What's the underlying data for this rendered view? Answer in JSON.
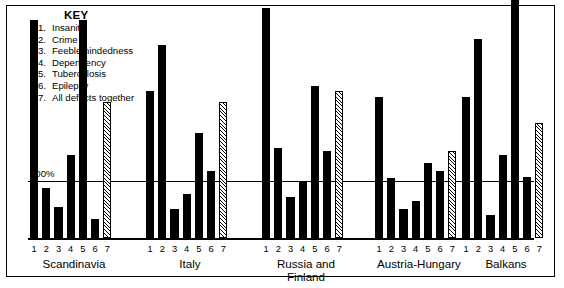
{
  "key": {
    "title": "KEY",
    "items": [
      {
        "num": "1.",
        "label": "Insanity"
      },
      {
        "num": "2.",
        "label": "Crime"
      },
      {
        "num": "3.",
        "label": "Feeblemindedness"
      },
      {
        "num": "4.",
        "label": "Dependency"
      },
      {
        "num": "5.",
        "label": "Tuberculosis"
      },
      {
        "num": "6.",
        "label": "Epilepsy"
      },
      {
        "num": "7.",
        "label": "All defects together"
      }
    ]
  },
  "axis": {
    "reference_label": "100%"
  },
  "chart_data": {
    "type": "bar",
    "title": "",
    "xlabel": "",
    "ylabel": "",
    "ylim": [
      0,
      470
    ],
    "grid": false,
    "reference_line": 100,
    "reference_line_label": "100%",
    "legend_position": "top-left",
    "categories": [
      "1",
      "2",
      "3",
      "4",
      "5",
      "6",
      "7"
    ],
    "category_names": [
      "Insanity",
      "Crime",
      "Feeblemindedness",
      "Dependency",
      "Tuberculosis",
      "Epilepsy",
      "All defects together"
    ],
    "groups": [
      {
        "name": "Scandinavia",
        "values": [
          378,
          88,
          55,
          145,
          378,
          33,
          236
        ]
      },
      {
        "name": "Italy",
        "values": [
          255,
          335,
          50,
          76,
          183,
          116,
          236
        ]
      },
      {
        "name": "Russia and\nFinland",
        "values": [
          400,
          157,
          71,
          97,
          264,
          152,
          255
        ]
      },
      {
        "name": "Austria-Hungary",
        "values": [
          245,
          105,
          50,
          64,
          131,
          116,
          152
        ]
      },
      {
        "name": "Balkans",
        "values": [
          245,
          345,
          40,
          145,
          455,
          107,
          200
        ]
      }
    ],
    "series_styles": [
      {
        "category": "1",
        "fill": "solid",
        "color": "#000000"
      },
      {
        "category": "2",
        "fill": "solid",
        "color": "#000000"
      },
      {
        "category": "3",
        "fill": "solid",
        "color": "#000000"
      },
      {
        "category": "4",
        "fill": "solid",
        "color": "#000000"
      },
      {
        "category": "5",
        "fill": "solid",
        "color": "#000000"
      },
      {
        "category": "6",
        "fill": "solid",
        "color": "#000000"
      },
      {
        "category": "7",
        "fill": "diagonal-hatch",
        "color": "#000000"
      }
    ]
  }
}
